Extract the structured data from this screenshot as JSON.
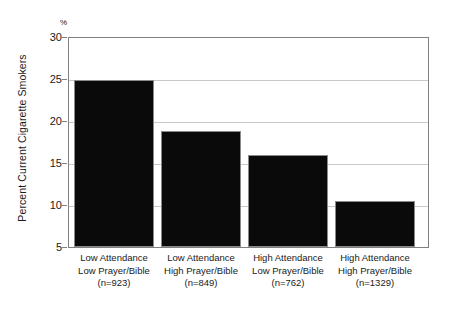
{
  "chart_data": {
    "type": "bar",
    "title": "",
    "xlabel": "",
    "ylabel": "Percent Current Cigarette Smokers",
    "yunit": "%",
    "ylim": [
      5,
      30
    ],
    "yticks": [
      5,
      10,
      15,
      20,
      25,
      30
    ],
    "grid": true,
    "legend": false,
    "categories": [
      "Low Attendance\nLow Prayer/Bible\n(n=923)",
      "Low Attendance\nHigh Prayer/Bible\n(n=849)",
      "High Attendance\nLow Prayer/Bible\n(n=762)",
      "High Attendance\nHigh Prayer/Bible\n(n=1329)"
    ],
    "values": [
      25.0,
      18.9,
      16.0,
      10.5
    ],
    "bar_color": "#0a0a0a",
    "bar_edge_color": "#8a8a8a",
    "grid_color": "#c8c8c8",
    "axis_color": "#808080"
  },
  "axis": {
    "y_title": "Percent Current Cigarette Smokers",
    "percent_symbol": "%",
    "ytick_labels": [
      "30",
      "25",
      "20",
      "15",
      "10",
      "5"
    ]
  },
  "categories": [
    {
      "line1": "Low Attendance",
      "line2": "Low Prayer/Bible",
      "line3": "(n=923)",
      "value": 25.0
    },
    {
      "line1": "Low Attendance",
      "line2": "High Prayer/Bible",
      "line3": "(n=849)",
      "value": 18.9
    },
    {
      "line1": "High Attendance",
      "line2": "Low Prayer/Bible",
      "line3": "(n=762)",
      "value": 16.0
    },
    {
      "line1": "High Attendance",
      "line2": "High Prayer/Bible",
      "line3": "(n=1329)",
      "value": 10.5
    }
  ]
}
